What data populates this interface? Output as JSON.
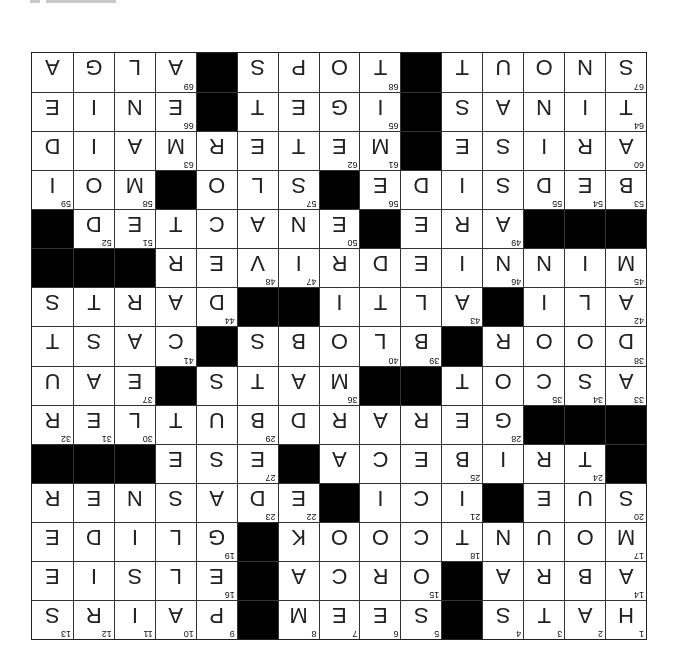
{
  "puzzle": {
    "rows": 15,
    "cols": 15,
    "orientation_deg": 180,
    "colors": {
      "block": "#000000",
      "cell": "#ffffff",
      "text": "#222222"
    },
    "grid": [
      "HATS#SEEM#PAIRS",
      "ABRA#ORCA#ELSIE",
      "MOUNTCOOK#GLIDE",
      "SUE#ICI#EDASNER",
      "#TRIBECA#ESE###",
      "###GERARDBUTLER",
      "ASCOT##MATS#EAU",
      "DOOR#BLOBS#CAST",
      "ALI#ALTI##DARTS",
      "MINNIEDRIVER###",
      "###ARE#ENACTED#",
      "BEDSIDE#SLO#MOI",
      "ARISE#METERMAID",
      "TINAS#IGET#ENIE",
      "SNOUT#TOPS#ALGA"
    ],
    "numbers": {
      "0,0": "1",
      "0,1": "2",
      "0,2": "3",
      "0,3": "4",
      "0,5": "5",
      "0,6": "6",
      "0,7": "7",
      "0,8": "8",
      "0,10": "9",
      "0,11": "10",
      "0,12": "11",
      "0,13": "12",
      "0,14": "13",
      "1,0": "14",
      "1,5": "15",
      "1,10": "16",
      "2,0": "17",
      "2,4": "18",
      "2,10": "19",
      "3,0": "20",
      "3,4": "21",
      "3,8": "22",
      "3,9": "23",
      "4,1": "24",
      "4,4": "25",
      "4,8": "26",
      "4,9": "27",
      "5,3": "28",
      "5,9": "29",
      "5,12": "30",
      "5,13": "31",
      "5,14": "32",
      "6,0": "33",
      "6,1": "34",
      "6,2": "35",
      "6,7": "36",
      "6,12": "37",
      "7,0": "38",
      "7,5": "39",
      "7,6": "40",
      "7,11": "41",
      "8,0": "42",
      "8,4": "43",
      "8,10": "44",
      "9,0": "45",
      "9,3": "46",
      "9,8": "47",
      "9,9": "48",
      "10,3": "49",
      "10,7": "50",
      "10,12": "51",
      "10,13": "52",
      "11,0": "53",
      "11,1": "54",
      "11,2": "55",
      "11,6": "56",
      "11,8": "57",
      "11,12": "58",
      "11,14": "59",
      "12,0": "60",
      "12,6": "61",
      "12,7": "62",
      "12,11": "63",
      "13,0": "64",
      "13,6": "65",
      "13,11": "66",
      "14,0": "67",
      "14,6": "68",
      "14,11": "69"
    }
  }
}
